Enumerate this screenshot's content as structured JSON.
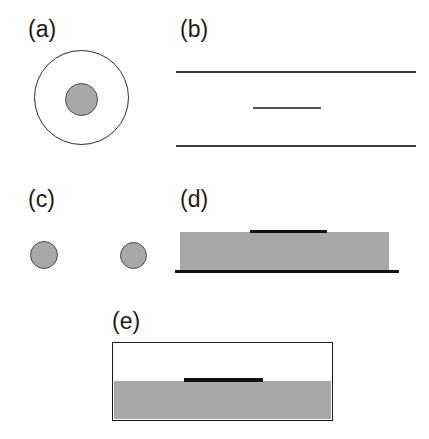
{
  "figure": {
    "width": 429,
    "height": 439,
    "background": "#ffffff",
    "panel_count": 5
  },
  "colors": {
    "gray_fill": "#a8a8a8",
    "line_dark": "#3a3a3a",
    "bar_black": "#111111",
    "outline": "#2b2b2b",
    "label_text": "#1a1a1a",
    "white": "#ffffff"
  },
  "panels": [
    {
      "id": "a",
      "label": "(a)",
      "description": "concentric circles: large open circle with small shaded disk at center",
      "shapes": {
        "outer_circle": {
          "cx": 81.5,
          "cy": 97.5,
          "diameter": 95
        },
        "inner_disk": {
          "cx": 81.5,
          "cy": 99,
          "diameter": 33
        }
      }
    },
    {
      "id": "b",
      "label": "(b)",
      "description": "two long parallel horizontal lines with one short centered line between them",
      "shapes": {
        "line_top": {
          "x1": 176,
          "x2": 416,
          "y": 71
        },
        "line_middle_short": {
          "x1": 253,
          "x2": 321,
          "y": 107
        },
        "line_bottom": {
          "x1": 176,
          "x2": 416,
          "y": 145
        }
      }
    },
    {
      "id": "c",
      "label": "(c)",
      "description": "two separated small shaded disks side by side",
      "shapes": {
        "disk_left": {
          "cx": 43.5,
          "cy": 255,
          "diameter": 28
        },
        "disk_right": {
          "cx": 133.5,
          "cy": 255,
          "diameter": 27
        }
      }
    },
    {
      "id": "d",
      "label": "(d)",
      "description": "shaded rectangular slab with short thick black bar on its top surface and a long thick black baseline beneath",
      "shapes": {
        "slab": {
          "x": 180,
          "y": 232,
          "width": 209,
          "height": 39
        },
        "bar_top": {
          "x1": 250,
          "x2": 327,
          "y": 232
        },
        "baseline": {
          "x1": 175,
          "x2": 399,
          "y": 271
        }
      }
    },
    {
      "id": "e",
      "label": "(e)",
      "description": "outlined rectangular box, lower half shaded, with short thick black bar lying at the interface",
      "shapes": {
        "box": {
          "x": 112,
          "y": 342,
          "width": 221,
          "height": 79
        },
        "fill_lower": {
          "x": 114,
          "y": 381,
          "width": 217,
          "height": 38
        },
        "bar_interface": {
          "x1": 184,
          "x2": 263,
          "y": 378
        }
      }
    }
  ]
}
